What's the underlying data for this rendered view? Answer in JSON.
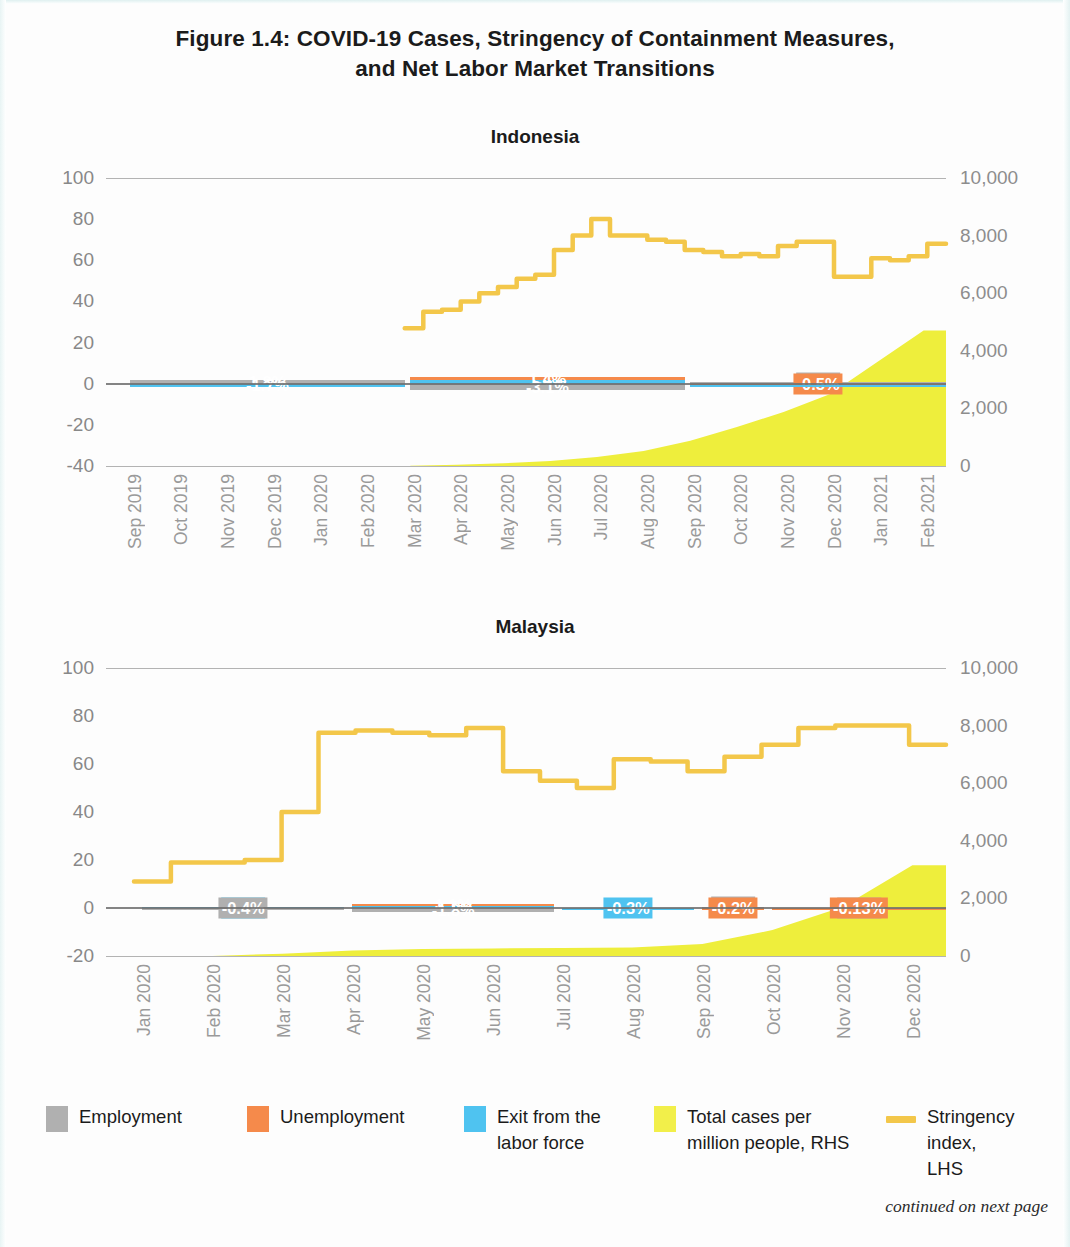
{
  "figure": {
    "title_line1": "Figure 1.4: COVID-19 Cases, Stringency of Containment Measures,",
    "title_line2": "and Net Labor Market Transitions",
    "footnote": "continued on next page"
  },
  "legend": {
    "items": [
      {
        "label": "Employment",
        "color": "#b0b0b0",
        "type": "swatch",
        "name": "employment"
      },
      {
        "label": "Unemployment",
        "color": "#f58a4b",
        "type": "swatch",
        "name": "unemployment"
      },
      {
        "label": "Exit from the\nlabor force",
        "color": "#4fc3f0",
        "type": "swatch",
        "name": "exit-labor-force"
      },
      {
        "label": "Total cases per\nmillion people, RHS",
        "color": "#f2ef4a",
        "type": "swatch",
        "name": "total-cases"
      },
      {
        "label": "Stringency index,\nLHS",
        "color": "#f5c council",
        "type": "line",
        "name": "stringency-index"
      }
    ],
    "labels": {
      "employment": "Employment",
      "unemployment": "Unemployment",
      "exit_l1": "Exit from the",
      "exit_l2": "labor force",
      "cases_l1": "Total cases per",
      "cases_l2": "million people, RHS",
      "stringency_l1": "Stringency index,",
      "stringency_l2": "LHS"
    }
  },
  "colors": {
    "employment": "#b0b0b0",
    "unemployment": "#f58a4b",
    "exit": "#4fc3f0",
    "cases": "#eeee3c",
    "stringency": "#f3c74a",
    "axis_text": "#8d8d8d",
    "grid": "#9a9a9a"
  },
  "chart_data": [
    {
      "type": "line",
      "name": "indonesia",
      "title": "Indonesia",
      "ylabel": "",
      "xlabel": "",
      "ylim": [
        -40,
        100
      ],
      "yticks": [
        100,
        80,
        60,
        40,
        20,
        0,
        -20,
        -40
      ],
      "ytick_labels": [
        "100",
        "80",
        "60",
        "40",
        "20",
        "0",
        "-20",
        "-40"
      ],
      "y2lim": [
        0,
        10000
      ],
      "y2ticks": [
        10000,
        8000,
        6000,
        4000,
        2000,
        0
      ],
      "y2tick_labels": [
        "10,000",
        "8,000",
        "6,000",
        "4,000",
        "2,000",
        "0"
      ],
      "grid": true,
      "legend_position": "bottom",
      "categories": [
        "Sep 2019",
        "Oct 2019",
        "Nov 2019",
        "Dec 2019",
        "Jan 2020",
        "Feb 2020",
        "Mar 2020",
        "Apr 2020",
        "May 2020",
        "Jun 2020",
        "Jul 2020",
        "Aug 2020",
        "Sep 2020",
        "Oct 2020",
        "Nov 2020",
        "Dec 2020",
        "Jan 2021",
        "Feb 2021"
      ],
      "bar_groups": [
        {
          "span": [
            "Sep 2019",
            "Mar 2020"
          ],
          "segments": [
            {
              "series": "Employment",
              "value": 1.8,
              "label": "1.8%",
              "label_style": "plain"
            },
            {
              "series": "Exit from the labor force",
              "value": -1.7,
              "label": "-1.7%",
              "label_style": "plain"
            }
          ]
        },
        {
          "span": [
            "Mar 2020",
            "Sep 2020"
          ],
          "segments": [
            {
              "series": "Exit from the labor force",
              "value": 1.8,
              "label": "1.8%",
              "label_style": "plain"
            },
            {
              "series": "Unemployment",
              "value": 1.4,
              "label": "1.4%",
              "label_style": "plain"
            },
            {
              "series": "Employment",
              "value": -3.1,
              "label": "-3.1%",
              "label_style": "plain"
            }
          ]
        },
        {
          "span": [
            "Sep 2020",
            "Feb 2021"
          ],
          "segments": [
            {
              "series": "Employment",
              "value": 0.8,
              "label": "0.8%",
              "label_style": "boxed"
            },
            {
              "series": "Unemployment",
              "value": -0.5,
              "label": "-0.5%",
              "label_style": "boxed"
            },
            {
              "series": "Exit from the labor force",
              "value": -0.3,
              "label": "",
              "label_style": "none"
            }
          ]
        }
      ],
      "series": [
        {
          "name": "Stringency index, LHS",
          "axis": "left",
          "units": "index 0-100",
          "x": [
            "Mar 2020",
            "Mar 2020",
            "Mar 2020",
            "Mar 2020",
            "Apr 2020",
            "Apr 2020",
            "Apr 2020",
            "Apr 2020",
            "May 2020",
            "May 2020",
            "May 2020",
            "Jun 2020",
            "Jun 2020",
            "Jul 2020",
            "Jul 2020",
            "Aug 2020",
            "Aug 2020",
            "Sep 2020",
            "Sep 2020",
            "Oct 2020",
            "Oct 2020",
            "Nov 2020",
            "Nov 2020",
            "Dec 2020",
            "Dec 2020",
            "Jan 2021",
            "Jan 2021",
            "Feb 2021",
            "Feb 2021"
          ],
          "values": [
            27,
            35,
            36,
            40,
            44,
            47,
            51,
            53,
            65,
            72,
            80,
            72,
            72,
            70,
            69,
            65,
            64,
            62,
            63,
            62,
            67,
            69,
            69,
            52,
            52,
            61,
            60,
            62,
            68
          ]
        },
        {
          "name": "Total cases per million people, RHS",
          "axis": "right",
          "units": "cases per million",
          "x": [
            "Mar 2020",
            "Apr 2020",
            "May 2020",
            "Jun 2020",
            "Jul 2020",
            "Aug 2020",
            "Sep 2020",
            "Oct 2020",
            "Nov 2020",
            "Dec 2020",
            "Jan 2021",
            "Feb 2021"
          ],
          "values": [
            8,
            40,
            95,
            170,
            310,
            520,
            880,
            1350,
            1880,
            2500,
            3600,
            4700
          ]
        }
      ]
    },
    {
      "type": "line",
      "name": "malaysia",
      "title": "Malaysia",
      "ylabel": "",
      "xlabel": "",
      "ylim": [
        -20,
        100
      ],
      "yticks": [
        100,
        80,
        60,
        40,
        20,
        0,
        -20
      ],
      "ytick_labels": [
        "100",
        "80",
        "60",
        "40",
        "20",
        "0",
        "-20"
      ],
      "y2lim": [
        0,
        10000
      ],
      "y2ticks": [
        10000,
        8000,
        6000,
        4000,
        2000,
        0
      ],
      "y2tick_labels": [
        "10,000",
        "8,000",
        "6,000",
        "4,000",
        "2,000",
        "0"
      ],
      "grid": true,
      "legend_position": "bottom",
      "categories": [
        "Jan 2020",
        "Feb 2020",
        "Mar 2020",
        "Apr 2020",
        "May 2020",
        "Jun 2020",
        "Jul 2020",
        "Aug 2020",
        "Sep 2020",
        "Oct 2020",
        "Nov 2020",
        "Dec 2020"
      ],
      "bar_groups": [
        {
          "span": [
            "Jan 2020",
            "Apr 2020"
          ],
          "segments": [
            {
              "series": "Exit from the labor force",
              "value": 0.3,
              "label": "0.3%",
              "label_style": "boxed"
            },
            {
              "series": "Employment",
              "value": -0.4,
              "label": "-0.4%",
              "label_style": "boxed"
            }
          ]
        },
        {
          "span": [
            "Apr 2020",
            "Jul 2020"
          ],
          "segments": [
            {
              "series": "Exit from the labor force",
              "value": 0.7,
              "label": "0.7%",
              "label_style": "plain"
            },
            {
              "series": "Unemployment",
              "value": 1.1,
              "label": "1.1%",
              "label_style": "plain"
            },
            {
              "series": "Employment",
              "value": -1.8,
              "label": "-1.8%",
              "label_style": "plain"
            }
          ]
        },
        {
          "span": [
            "Jul 2020",
            "Sep 2020"
          ],
          "segments": [
            {
              "series": "Exit from the labor force",
              "value": -0.3,
              "label": "-0.3%",
              "label_style": "boxed"
            }
          ]
        },
        {
          "span": [
            "Sep 2020",
            "Oct 2020"
          ],
          "segments": [
            {
              "series": "Employment",
              "value": 0.5,
              "label": "0.5%",
              "label_style": "boxed"
            },
            {
              "series": "Unemployment",
              "value": -0.2,
              "label": "-0.2%",
              "label_style": "boxed"
            }
          ]
        },
        {
          "span": [
            "Oct 2020",
            "Dec 2020"
          ],
          "segments": [
            {
              "series": "Employment",
              "value": 0.1,
              "label": "0.1%",
              "label_style": "boxed"
            },
            {
              "series": "Unemployment",
              "value": -0.13,
              "label": "-0.13%",
              "label_style": "boxed"
            }
          ]
        }
      ],
      "series": [
        {
          "name": "Stringency index, LHS",
          "axis": "left",
          "units": "index 0-100",
          "x": [
            "Jan 2020",
            "Feb 2020",
            "Feb 2020",
            "Mar 2020",
            "Mar 2020",
            "Mar 2020",
            "Apr 2020",
            "May 2020",
            "Jun 2020",
            "Jun 2020",
            "Jul 2020",
            "Jul 2020",
            "Aug 2020",
            "Aug 2020",
            "Sep 2020",
            "Sep 2020",
            "Oct 2020",
            "Oct 2020",
            "Nov 2020",
            "Nov 2020",
            "Dec 2020",
            "Dec 2020"
          ],
          "values": [
            11,
            19,
            19,
            20,
            40,
            73,
            74,
            73,
            72,
            75,
            57,
            53,
            50,
            62,
            61,
            57,
            63,
            68,
            75,
            76,
            76,
            68
          ]
        },
        {
          "name": "Total cases per million people, RHS",
          "axis": "right",
          "units": "cases per million",
          "x": [
            "Jan 2020",
            "Feb 2020",
            "Mar 2020",
            "Apr 2020",
            "May 2020",
            "Jun 2020",
            "Jul 2020",
            "Aug 2020",
            "Sep 2020",
            "Oct 2020",
            "Nov 2020",
            "Dec 2020"
          ],
          "values": [
            1,
            5,
            80,
            190,
            240,
            260,
            280,
            300,
            420,
            900,
            1700,
            3150
          ]
        }
      ]
    }
  ]
}
